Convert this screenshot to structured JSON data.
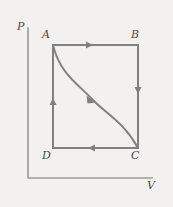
{
  "figure": {
    "background_color": "#f2f1ef",
    "line_color": "#808080",
    "label_color": "#4a4a4a"
  },
  "axes": {
    "y_label": "P",
    "x_label": "V",
    "origin": {
      "x": 28,
      "y": 178
    },
    "y_top": {
      "x": 28,
      "y": 28
    },
    "x_right": {
      "x": 152,
      "y": 178
    }
  },
  "vertices": {
    "A": {
      "label": "A",
      "x": 53,
      "y": 45
    },
    "B": {
      "label": "B",
      "x": 138,
      "y": 45
    },
    "C": {
      "label": "C",
      "x": 138,
      "y": 148
    },
    "D": {
      "label": "D",
      "x": 53,
      "y": 148
    }
  },
  "chart_data": {
    "type": "line",
    "title": "",
    "xlabel": "V",
    "ylabel": "P",
    "grid": false,
    "legend": null,
    "annotations": [
      "A",
      "B",
      "C",
      "D"
    ],
    "series": [
      {
        "name": "A to B (isobaric expansion)",
        "path": "rectangle-top",
        "from": "A",
        "to": "B",
        "direction": "right",
        "points": [
          [
            53,
            45
          ],
          [
            138,
            45
          ]
        ]
      },
      {
        "name": "B to C (isochoric)",
        "path": "rectangle-right",
        "from": "B",
        "to": "C",
        "direction": "down",
        "points": [
          [
            138,
            45
          ],
          [
            138,
            148
          ]
        ]
      },
      {
        "name": "C to D (isobaric compression)",
        "path": "rectangle-bottom",
        "from": "C",
        "to": "D",
        "direction": "left",
        "points": [
          [
            138,
            148
          ],
          [
            53,
            148
          ]
        ]
      },
      {
        "name": "D to A (isochoric)",
        "path": "rectangle-left",
        "from": "D",
        "to": "A",
        "direction": "up",
        "points": [
          [
            53,
            148
          ],
          [
            53,
            45
          ]
        ]
      },
      {
        "name": "A to C (S-shaped curve)",
        "path": "curve",
        "from": "A",
        "to": "C",
        "direction": "down-right",
        "points": [
          [
            53,
            45
          ],
          [
            72,
            88
          ],
          [
            92,
            99
          ],
          [
            112,
            112
          ],
          [
            138,
            148
          ]
        ]
      }
    ],
    "arrows": [
      {
        "on": "A to B",
        "x": 91,
        "y": 45,
        "points": "right"
      },
      {
        "on": "B to C",
        "x": 138,
        "y": 92,
        "points": "down"
      },
      {
        "on": "C to D",
        "x": 90,
        "y": 148,
        "points": "left"
      },
      {
        "on": "D to A",
        "x": 53,
        "y": 101,
        "points": "up"
      },
      {
        "on": "A to C",
        "x": 92,
        "y": 99,
        "points": "down-right"
      }
    ]
  }
}
